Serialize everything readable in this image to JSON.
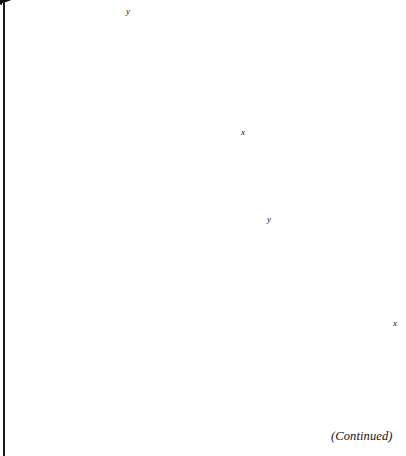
{
  "page": {
    "width": 406,
    "height": 456,
    "background": "#ffffff",
    "left_rule_color": "#1a1a1a",
    "caption": "(Continued)"
  },
  "style": {
    "axis_color": "#2b2b2b",
    "line_color": "#111111",
    "shade_fill": "#d7d7d7",
    "shade_opacity": 1,
    "axis_stroke_width": 1.6,
    "tick_length": 7,
    "boundary_stroke_width": 1.5
  },
  "chart_data": [
    {
      "id": "graph-1",
      "type": "scatter",
      "title": "",
      "subtitle": "",
      "xlabel": "x",
      "ylabel": "y",
      "grid": false,
      "legend": "none",
      "xlim": [
        -6,
        6
      ],
      "ylim": [
        -6,
        6
      ],
      "tick_step": 1,
      "origin_px": [
        131,
        132
      ],
      "unit_px": 17,
      "x_axis_start_px": [
        22,
        132
      ],
      "x_axis_end_px": [
        235,
        132
      ],
      "y_axis_start_px": [
        131,
        208
      ],
      "y_axis_end_px": [
        131,
        22
      ],
      "x_ticks": [
        -5,
        -4,
        -3,
        -2,
        -1,
        1,
        2,
        3,
        4,
        5
      ],
      "y_ticks": [
        -4,
        -3,
        -2,
        -1,
        1,
        2,
        3,
        4
      ],
      "boundary_line": {
        "style": "solid",
        "slope": 2,
        "intercept": 4,
        "p1_px": [
          65,
          165
        ],
        "p2_px": [
          158,
          26
        ],
        "arrow_both_ends": true,
        "description": "solid line rising to the right with arrowheads at both ends"
      },
      "shaded_region": {
        "description": "rotated rectangular shaded block to the right of the boundary line",
        "polygon_px": [
          [
            104,
            58
          ],
          [
            210,
            89
          ],
          [
            184,
            185
          ],
          [
            80,
            154
          ]
        ],
        "fill": "#d7d7d7"
      }
    },
    {
      "id": "graph-2",
      "type": "scatter",
      "title": "",
      "subtitle": "",
      "xlabel": "x",
      "ylabel": "y",
      "grid": false,
      "legend": "none",
      "xlim": [
        -6,
        6
      ],
      "ylim": [
        -6,
        6
      ],
      "tick_step": 1,
      "origin_px": [
        272,
        323
      ],
      "unit_px": 17,
      "x_axis_start_px": [
        190,
        323
      ],
      "x_axis_end_px": [
        398,
        323
      ],
      "y_axis_start_px": [
        272,
        402
      ],
      "y_axis_end_px": [
        272,
        230
      ],
      "x_ticks": [
        -4,
        -3,
        -2,
        -1,
        1,
        2,
        3,
        4,
        5,
        6
      ],
      "y_ticks": [
        -4,
        -3,
        -2,
        -1,
        1,
        2,
        3,
        4
      ],
      "boundary_line": {
        "style": "solid",
        "slope": 2,
        "intercept": 5,
        "p1_px": [
          211,
          357
        ],
        "p2_px": [
          295,
          231
        ],
        "arrow_both_ends": true,
        "description": "solid line rising to the right with arrowheads at both ends"
      },
      "shaded_region": {
        "description": "rotated rectangular shaded block to the left of the boundary line",
        "polygon_px": [
          [
            222,
            212
          ],
          [
            279,
            257
          ],
          [
            212,
            340
          ],
          [
            156,
            296
          ]
        ],
        "fill": "#d7d7d7"
      }
    }
  ],
  "labels": {
    "graph1_x": "x",
    "graph1_y": "y",
    "graph2_x": "x",
    "graph2_y": "y"
  }
}
